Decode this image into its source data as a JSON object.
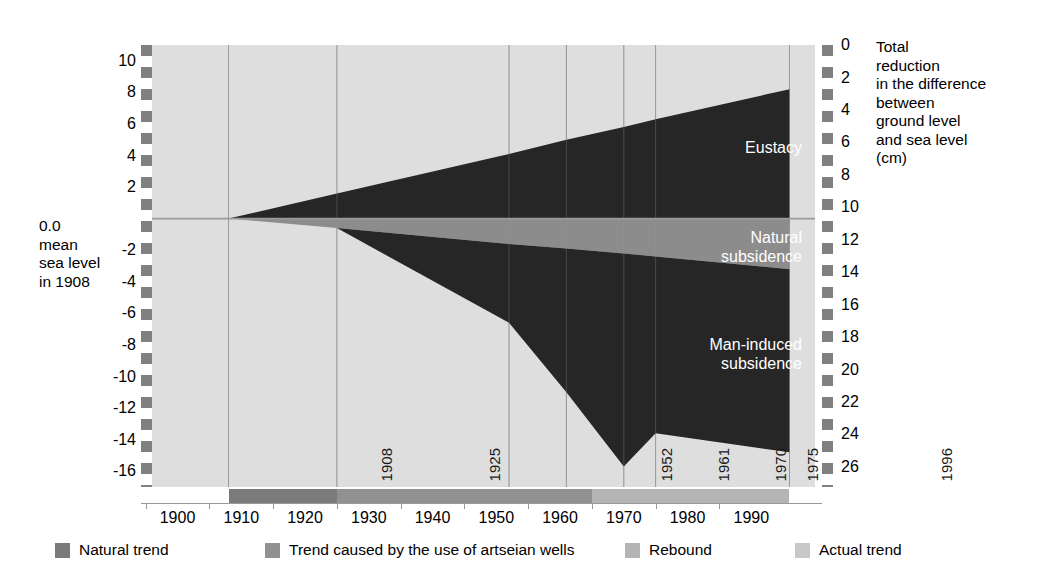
{
  "chart_data": {
    "type": "area",
    "title": "",
    "subtitle": "",
    "xlabel": "",
    "ylabel": "",
    "left_axis": {
      "label_lines": [
        "0.0",
        "mean",
        "sea level",
        "in 1908"
      ],
      "ticks": [
        10,
        8,
        6,
        4,
        2,
        -2,
        -4,
        -6,
        -8,
        -10,
        -12,
        -14,
        -16
      ],
      "range": [
        -17,
        11
      ],
      "unit": "cm"
    },
    "right_axis": {
      "caption_lines": [
        "Total",
        "reduction",
        "in the difference",
        "between",
        "ground level",
        "and sea level",
        "(cm)"
      ],
      "ticks": [
        0,
        2,
        4,
        6,
        8,
        10,
        12,
        14,
        16,
        18,
        20,
        22,
        24,
        26
      ],
      "range": [
        0,
        27
      ],
      "unit": "cm"
    },
    "x": {
      "ticks": [
        1900,
        1910,
        1920,
        1930,
        1940,
        1950,
        1960,
        1970,
        1980,
        1990
      ],
      "range": [
        1896,
        2000
      ],
      "event_years": [
        1908,
        1925,
        1952,
        1961,
        1970,
        1975,
        1996
      ]
    },
    "grid": "vertical-at-event-years",
    "legend_position": "bottom",
    "series": [
      {
        "name": "Eustacy",
        "color": "#262626",
        "points": [
          {
            "year": 1908,
            "value": 0.0
          },
          {
            "year": 1925,
            "value": 1.6
          },
          {
            "year": 1952,
            "value": 4.1
          },
          {
            "year": 1961,
            "value": 5.0
          },
          {
            "year": 1970,
            "value": 5.8
          },
          {
            "year": 1975,
            "value": 6.3
          },
          {
            "year": 1996,
            "value": 8.2
          }
        ]
      },
      {
        "name": "Natural subsidence",
        "color": "#8c8c8c",
        "points": [
          {
            "year": 1908,
            "value": 0.0
          },
          {
            "year": 1925,
            "value": -0.6
          },
          {
            "year": 1952,
            "value": -1.6
          },
          {
            "year": 1961,
            "value": -1.9
          },
          {
            "year": 1970,
            "value": -2.2
          },
          {
            "year": 1975,
            "value": -2.4
          },
          {
            "year": 1996,
            "value": -3.2
          }
        ]
      },
      {
        "name": "Man-induced subsidence",
        "color": "#262626",
        "points": [
          {
            "year": 1908,
            "value": 0.0
          },
          {
            "year": 1925,
            "value": -0.6
          },
          {
            "year": 1952,
            "value": -6.6
          },
          {
            "year": 1961,
            "value": -11.0
          },
          {
            "year": 1970,
            "value": -15.7
          },
          {
            "year": 1975,
            "value": -13.6
          },
          {
            "year": 1996,
            "value": -14.8
          }
        ]
      }
    ],
    "annotations": [
      {
        "text": "Eustacy",
        "year": 1984,
        "value": 5.2
      },
      {
        "text": "Natural subsidence",
        "year": 1986,
        "value": -1.5
      },
      {
        "text": "Man-induced subsidence",
        "year": 1985,
        "value": -8.0
      }
    ],
    "timeline_segments": [
      {
        "from": 1908,
        "to": 1925,
        "color": "#7a7a7a",
        "legend": "Natural trend"
      },
      {
        "from": 1925,
        "to": 1965,
        "color": "#919191",
        "legend": "Trend caused by the use of artseian wells"
      },
      {
        "from": 1965,
        "to": 1996,
        "color": "#b4b4b4",
        "legend": "Rebound"
      }
    ]
  },
  "left_axis_note": {
    "l1": "0.0",
    "l2": "mean",
    "l3": "sea level",
    "l4": "in 1908"
  },
  "right_caption": {
    "l1": "Total",
    "l2": "reduction",
    "l3": "in the difference",
    "l4": "between",
    "l5": "ground level",
    "l6": "and sea level",
    "l7": "(cm)"
  },
  "yticks_left": [
    "10",
    "8",
    "6",
    "4",
    "2",
    "-2",
    "-4",
    "-6",
    "-8",
    "-10",
    "-12",
    "-14",
    "-16"
  ],
  "yticks_right": [
    "0",
    "2",
    "4",
    "6",
    "8",
    "10",
    "12",
    "14",
    "16",
    "18",
    "20",
    "22",
    "24",
    "26"
  ],
  "xticks": [
    "1900",
    "1910",
    "1920",
    "1930",
    "1940",
    "1950",
    "1960",
    "1970",
    "1980",
    "1990"
  ],
  "event_years": [
    "1908",
    "1925",
    "1952",
    "1961",
    "1970",
    "1975",
    "1996"
  ],
  "area_labels": {
    "eustacy": "Eustacy",
    "natural_l1": "Natural",
    "natural_l2": "subsidence",
    "man_l1": "Man-induced",
    "man_l2": "subsidence"
  },
  "legend": {
    "items": [
      {
        "label": "Natural trend",
        "color": "#7a7a7a"
      },
      {
        "label": "Trend caused by the use of artseian wells",
        "color": "#919191"
      },
      {
        "label": "Rebound",
        "color": "#b4b4b4"
      },
      {
        "label": "Actual trend",
        "color": "#c8c8c8"
      }
    ]
  },
  "colors": {
    "plot_background": "#dedede",
    "dark_area": "#262626",
    "mid_gray_area": "#8c8c8c",
    "gridline": "#9a9a9a",
    "axis_dash_dark": "#808080",
    "axis_dash_light": "#ffffff"
  }
}
